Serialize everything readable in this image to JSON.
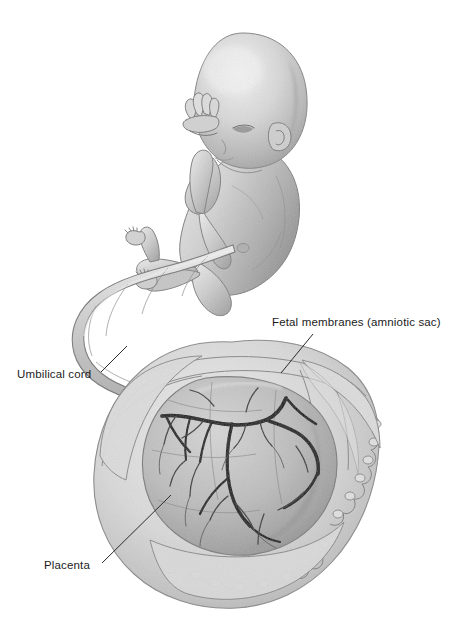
{
  "figure": {
    "style": "grayscale pencil / airbrush medical illustration",
    "background_color": "#ffffff",
    "width": 454,
    "height": 639
  },
  "annotations": [
    {
      "id": "fetal-membranes",
      "label": "Fetal membranes (amniotic sac)",
      "label_x": 272,
      "label_y": 316,
      "leader_from": [
        313,
        334
      ],
      "leader_to": [
        281,
        373
      ]
    },
    {
      "id": "umbilical-cord",
      "label": "Umbilical cord",
      "label_x": 17,
      "label_y": 368,
      "leader_from": [
        101,
        372
      ],
      "leader_to": [
        127,
        346
      ]
    },
    {
      "id": "placenta",
      "label": "Placenta",
      "label_x": 44,
      "label_y": 559,
      "leader_from": [
        102,
        563
      ],
      "leader_to": [
        171,
        495
      ]
    }
  ],
  "structures": [
    {
      "id": "fetus",
      "name": "Fetus",
      "region": "upper portion of image"
    },
    {
      "id": "fetal-head",
      "name": "Fetal head",
      "region": "top center"
    },
    {
      "id": "fetal-hands",
      "name": "Fetal hands",
      "region": "raised near face"
    },
    {
      "id": "fetal-feet",
      "name": "Fetal feet",
      "region": "crossed, lower left of fetus"
    },
    {
      "id": "umbilical-cord",
      "name": "Umbilical cord",
      "region": "looping from abdomen down to placenta"
    },
    {
      "id": "amniotic-sac",
      "name": "Fetal membranes (amniotic sac)",
      "region": "large ruffled sac, lower portion"
    },
    {
      "id": "placenta-disc",
      "name": "Placenta",
      "region": "inner disc within opened sac"
    },
    {
      "id": "chorionic-vessels",
      "name": "Chorionic blood vessels",
      "region": "dark branching vessels on placental surface"
    }
  ],
  "palette": {
    "ink": "#1c1c1c",
    "leader_line": "#2b2b2b",
    "skin_light": "#e9e9e9",
    "skin_mid": "#c9c9c9",
    "skin_shadow": "#9a9a9a",
    "skin_deep": "#7c7c7c",
    "outline": "#6e6e6e",
    "membrane_light": "#e4e4e4",
    "membrane_mid": "#cfcfcf",
    "membrane_shadow": "#a8a8a8",
    "placenta_mid": "#bdbdbd",
    "placenta_shadow": "#8e8e8e",
    "vessel_dark": "#151515",
    "vessel_thin": "#3a3a3a",
    "background": "#ffffff"
  }
}
